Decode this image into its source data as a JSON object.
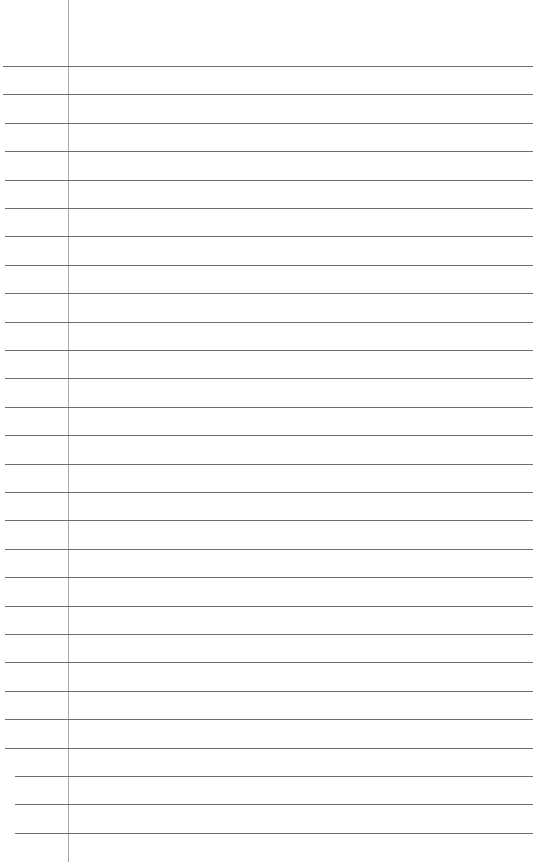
{
  "paper": {
    "type": "lined-paper",
    "line_count": 28,
    "first_line_y": 66,
    "line_spacing": 28.4,
    "margin_x": 68,
    "colors": {
      "background": "#ffffff",
      "rule": "#6e6e6e",
      "margin": "#a8a8a8"
    }
  }
}
